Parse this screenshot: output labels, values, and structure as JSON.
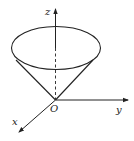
{
  "diagram": {
    "type": "3d-coordinate-cone",
    "labels": {
      "z_axis": "z",
      "y_axis": "y",
      "x_axis": "x",
      "origin": "O"
    },
    "colors": {
      "stroke": "#222222",
      "background": "#ffffff"
    }
  }
}
